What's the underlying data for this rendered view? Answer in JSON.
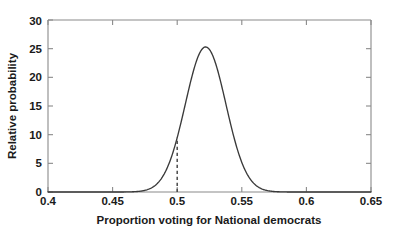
{
  "chart_data": {
    "type": "line",
    "title": "",
    "xlabel": "Proportion voting for National democrats",
    "ylabel": "Relative probability",
    "xlim": [
      0.4,
      0.65
    ],
    "ylim": [
      0,
      30
    ],
    "xticks": [
      "0.4",
      "0.45",
      "0.5",
      "0.55",
      "0.6",
      "0.65"
    ],
    "xtick_values": [
      0.4,
      0.45,
      0.5,
      0.55,
      0.6,
      0.65
    ],
    "yticks": [
      "0",
      "5",
      "10",
      "15",
      "20",
      "25",
      "30"
    ],
    "ytick_values": [
      0,
      5,
      10,
      15,
      20,
      25,
      30
    ],
    "grid": false,
    "legend": null,
    "series": [
      {
        "name": "posterior density",
        "distribution": "normal",
        "mean": 0.522,
        "sigma": 0.0157,
        "peak_value": 25.3,
        "peak_x": 0.522,
        "x": [
          0.4,
          0.41,
          0.42,
          0.43,
          0.44,
          0.45,
          0.455,
          0.46,
          0.465,
          0.47,
          0.475,
          0.48,
          0.485,
          0.49,
          0.495,
          0.5,
          0.505,
          0.51,
          0.515,
          0.52,
          0.525,
          0.53,
          0.535,
          0.54,
          0.545,
          0.55,
          0.555,
          0.56,
          0.565,
          0.57,
          0.575,
          0.58,
          0.59,
          0.6,
          0.62,
          0.65
        ],
        "y": [
          0.0,
          0.0,
          0.0,
          0.0,
          0.01,
          0.05,
          0.13,
          0.31,
          0.69,
          1.43,
          2.77,
          5.0,
          8.42,
          13.23,
          19.36,
          9.4,
          23.63,
          24.98,
          25.3,
          25.28,
          25.3,
          24.43,
          22.0,
          18.22,
          13.82,
          9.65,
          6.21,
          3.68,
          2.01,
          1.01,
          0.47,
          0.2,
          0.03,
          0.0,
          0.0,
          0.0
        ]
      }
    ],
    "annotations": [
      {
        "name": "threshold-line",
        "type": "vertical-dashed-line",
        "x": 0.5,
        "y_from": 0,
        "y_to": 9.4,
        "label": ""
      }
    ],
    "axis_color": "#8a8a8a",
    "curve_color": "#3a3a3a",
    "marker_color": "#4a4a4a",
    "background_color": "#ffffff"
  }
}
